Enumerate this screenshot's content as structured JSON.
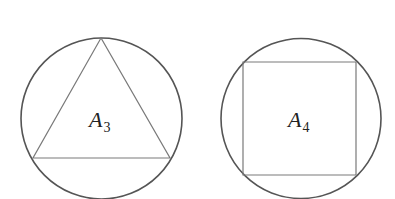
{
  "figures": [
    {
      "shape": "triangle",
      "label": "A",
      "subscript": "3",
      "circle": {
        "cx": 101.5,
        "cy": 118.5,
        "r": 80.5
      },
      "polygon": "101,38 33,158 170,158"
    },
    {
      "shape": "square",
      "label": "A",
      "subscript": "4",
      "circle": {
        "cx": 301,
        "cy": 118.5,
        "r": 80
      },
      "polygon": "243,62 356,62 356,175 243,175"
    }
  ],
  "colors": {
    "circle": "#555555",
    "polygon": "#7a7a7a",
    "background": "#ffffff"
  }
}
